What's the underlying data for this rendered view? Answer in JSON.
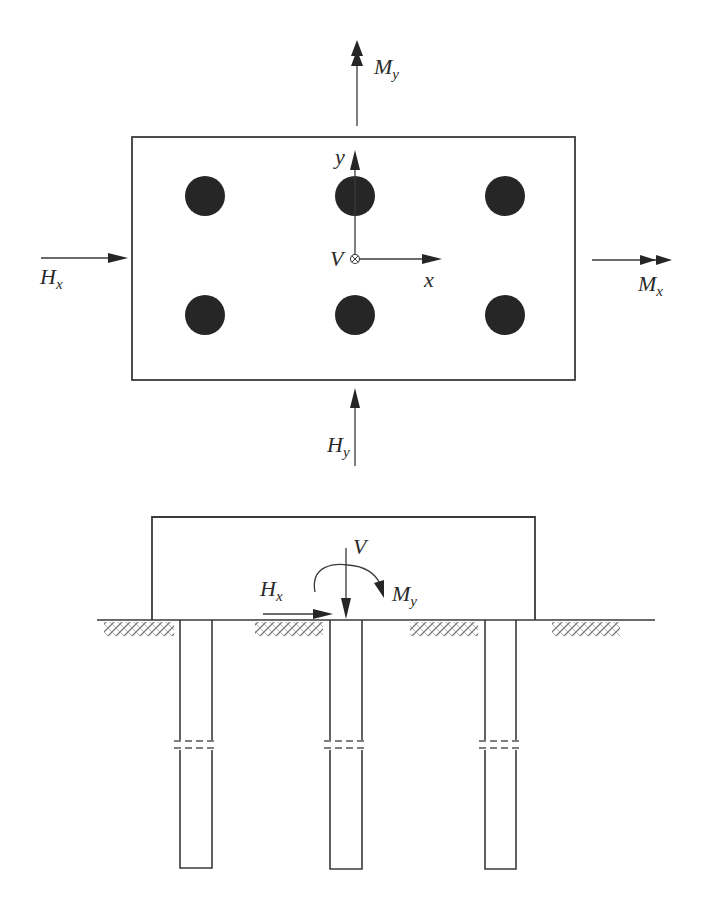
{
  "diagram": {
    "type": "pile-group foundation load diagram",
    "plan_view": {
      "name": "Pile cap plan view",
      "pile_rows": 2,
      "pile_cols": 3,
      "axes": {
        "x_label": "x",
        "y_label": "y",
        "origin_label": "V"
      },
      "loads": {
        "My": {
          "main": "M",
          "sub": "y"
        },
        "Mx": {
          "main": "M",
          "sub": "x"
        },
        "Hx": {
          "main": "H",
          "sub": "x"
        },
        "Hy": {
          "main": "H",
          "sub": "y"
        }
      }
    },
    "elevation_view": {
      "name": "Pile cap elevation view",
      "pile_count": 3,
      "loads": {
        "V": {
          "main": "V"
        },
        "Hx": {
          "main": "H",
          "sub": "x"
        },
        "My": {
          "main": "M",
          "sub": "y"
        }
      }
    },
    "colors": {
      "line": "#3a3a3a",
      "pile_fill": "#262626",
      "soil_hatch": "#777777",
      "background": "#ffffff"
    }
  }
}
